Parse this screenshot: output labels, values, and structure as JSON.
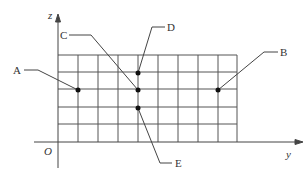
{
  "diagram": {
    "axes": {
      "z_label": "z",
      "y_label": "y",
      "origin_label": "O"
    },
    "grid": {
      "left": 58,
      "right": 237,
      "top": 55,
      "bottom": 142,
      "columns": 9,
      "rows": 5
    },
    "points": [
      {
        "name": "A",
        "x": 78,
        "y": 90
      },
      {
        "name": "B",
        "x": 218,
        "y": 90
      },
      {
        "name": "C",
        "x": 138,
        "y": 90
      },
      {
        "name": "D",
        "x": 138,
        "y": 73
      },
      {
        "name": "E",
        "x": 138,
        "y": 108
      }
    ],
    "labels": {
      "A": "A",
      "B": "B",
      "C": "C",
      "D": "D",
      "E": "E"
    },
    "colors": {
      "line": "#444444",
      "point": "#111111"
    }
  }
}
